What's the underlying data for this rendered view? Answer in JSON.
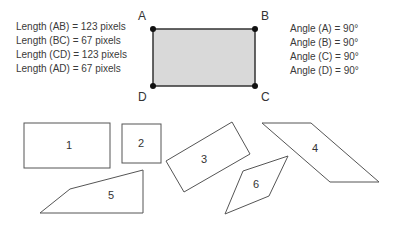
{
  "lengths": [
    "Length (AB) = 123 pixels",
    "Length (BC) = 67 pixels",
    "Length (CD) = 123 pixels",
    "Length (AD) = 67 pixels"
  ],
  "angles": [
    "Angle (A) = 90°",
    "Angle (B) = 90°",
    "Angle (C) = 90°",
    "Angle (D) = 90°"
  ],
  "vertices": {
    "A": "A",
    "B": "B",
    "C": "C",
    "D": "D"
  },
  "shapes": {
    "s1": "1",
    "s2": "2",
    "s3": "3",
    "s4": "4",
    "s5": "5",
    "s6": "6"
  },
  "colors": {
    "fill": "#d9d9d9",
    "stroke": "#333333",
    "outline": "#555555"
  }
}
